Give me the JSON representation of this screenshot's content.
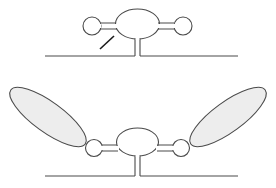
{
  "diagram": {
    "colors": {
      "background": "#ffffff",
      "outline": "#4a4a4a",
      "lobe_fill": "#ededed",
      "arrow": "#1a1a1a"
    },
    "panels": [
      {
        "id": "top",
        "labels": [],
        "components": [
          "baseline",
          "stem",
          "central-oval",
          "left-vesicle",
          "right-vesicle",
          "arrow"
        ]
      },
      {
        "id": "bottom",
        "labels": [],
        "components": [
          "baseline",
          "stem",
          "central-oval",
          "left-vesicle",
          "right-vesicle",
          "left-lobe",
          "right-lobe"
        ]
      }
    ]
  }
}
